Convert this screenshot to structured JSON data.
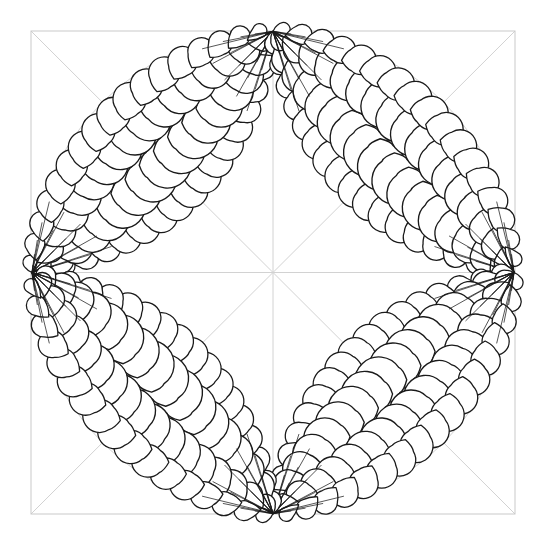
{
  "document": {
    "title": "Feathered Wreath Quilting Motif",
    "type": "line-art-pattern",
    "background_color": "#ffffff",
    "width": 547,
    "height": 543
  },
  "canvas": {
    "name": "quilting-pattern-canvas",
    "width": 547,
    "height": 543
  },
  "colors": {
    "ink": "#1a1a1a",
    "guide": "#c9c9c9",
    "guide_light": "#d8d8d8",
    "fill": "#ffffff",
    "background": "#ffffff"
  },
  "frame": {
    "name": "outer-square-frame",
    "left": 31,
    "top": 31,
    "right": 515,
    "bottom": 514,
    "stroke": "#c9c9c9",
    "stroke_width": 1,
    "fill": "none"
  },
  "guides": {
    "name": "construction-guides",
    "stroke": "#d2d2d2",
    "stroke_width": 1,
    "center": {
      "x": 273,
      "y": 272.5
    },
    "lines": [
      {
        "name": "diagonal-tl-br",
        "x1": 31,
        "y1": 31,
        "x2": 515,
        "y2": 514
      },
      {
        "name": "diagonal-tr-bl",
        "x1": 515,
        "y1": 31,
        "x2": 31,
        "y2": 514
      },
      {
        "name": "horizontal-midline",
        "x1": 31,
        "y1": 272.5,
        "x2": 515,
        "y2": 272.5
      },
      {
        "name": "vertical-midline",
        "x1": 273,
        "y1": 31,
        "x2": 273,
        "y2": 514
      }
    ]
  },
  "circle": {
    "name": "inscribed-guide-circle",
    "cx": 273,
    "cy": 272.5,
    "r": 241,
    "stroke": "#d2d2d2",
    "stroke_width": 1,
    "fill": "none"
  },
  "anchors": {
    "name": "cardinal-anchor-points",
    "top": {
      "x": 273,
      "y": 32
    },
    "right": {
      "x": 513,
      "y": 272.5
    },
    "bottom": {
      "x": 273,
      "y": 513
    },
    "left": {
      "x": 32,
      "y": 272.5
    }
  },
  "plumes": {
    "name": "feather-plume-set",
    "count": 4,
    "description": "Four vesica-shaped feather plumes, each spanning two adjacent cardinal points of the inscribed circle.",
    "items": [
      {
        "name": "plume-top-left",
        "label": "Top-Left Plume",
        "from": "left",
        "to": "top",
        "rotation_deg": 0,
        "bulge": 1.0
      },
      {
        "name": "plume-top-right",
        "label": "Top-Right Plume",
        "from": "top",
        "to": "right",
        "rotation_deg": 90,
        "bulge": 1.0
      },
      {
        "name": "plume-bottom-right",
        "label": "Bottom-Right Plume",
        "from": "right",
        "to": "bottom",
        "rotation_deg": 180,
        "bulge": 1.0
      },
      {
        "name": "plume-bottom-left",
        "label": "Bottom-Left Plume",
        "from": "bottom",
        "to": "left",
        "rotation_deg": 270,
        "bulge": 1.0
      }
    ],
    "spines_per_plume": 3,
    "spine_offsets": [
      -0.6,
      0.0,
      0.6
    ],
    "feathers_per_spine": 17,
    "feather": {
      "shape": "teardrop",
      "stroke": "#1a1a1a",
      "stroke_width": 1.35,
      "fill": "#ffffff",
      "max_radius": 24,
      "min_radius": 5
    }
  },
  "legend": {
    "visible": false
  }
}
